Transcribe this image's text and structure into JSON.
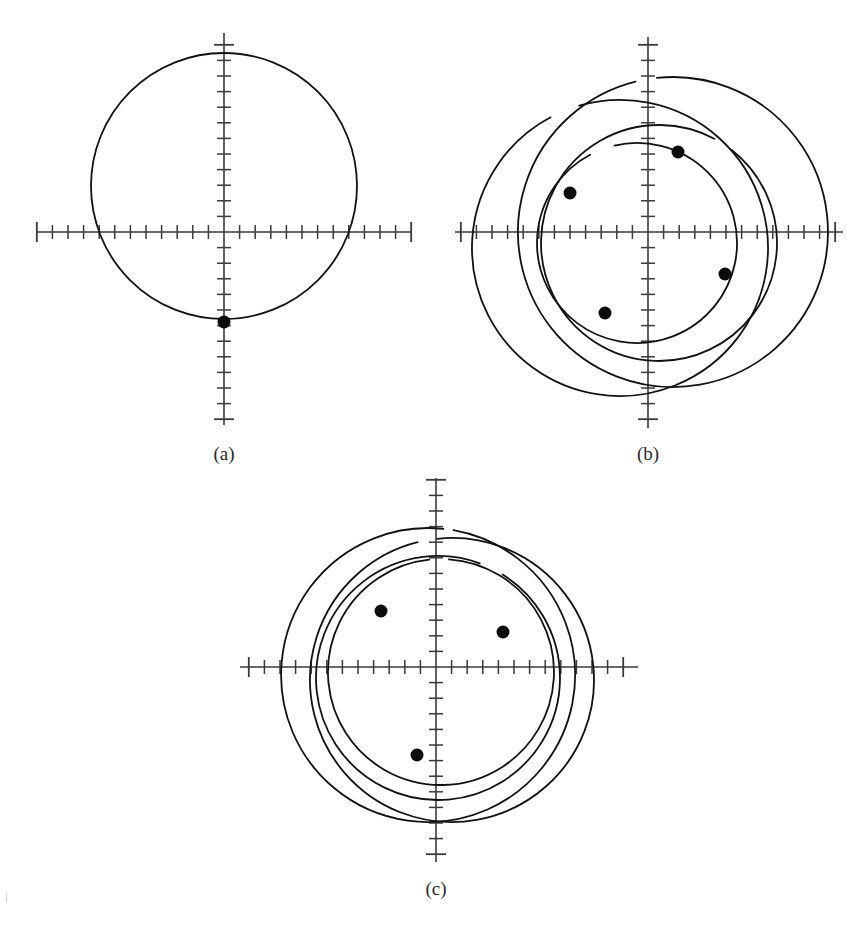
{
  "figure": {
    "domain": "Chart",
    "background_color": "#ffffff",
    "ink_color": "#111111",
    "axis_color": "#3a3a3a",
    "marker_color": "#0b0b0b",
    "width": 866,
    "height": 930,
    "panel_labels": {
      "a": "(a)",
      "b": "(b)",
      "c": "(c)"
    },
    "footer_text_fragment": ""
  },
  "chart_data": {
    "type": "line",
    "title": "",
    "subtitle": "",
    "xlabel": "",
    "ylabel": "",
    "grid": false,
    "legend": "none",
    "panel_count": 3,
    "panels": [
      {
        "id": "a",
        "label": "(a)",
        "label_position": {
          "x": 224,
          "y": 460
        },
        "origin": {
          "x": 224,
          "y": 232
        },
        "xaxis": {
          "x_start": 36,
          "x_end": 412,
          "ticks_left": 12,
          "ticks_right": 12,
          "tick_spacing": 15.6,
          "tick_half_len": 7,
          "end_tick_half_len": 10
        },
        "yaxis": {
          "y_start": 33,
          "y_end": 425,
          "ticks_up": 12,
          "ticks_down": 12,
          "tick_spacing": 15.6,
          "tick_half_len": 7,
          "end_tick_half_len": 10
        },
        "curves": [
          {
            "name": "orbit-1",
            "kind": "circle",
            "cx": 224,
            "cy": 186,
            "r": 133,
            "start_deg": 0,
            "sweep_deg": 360
          }
        ],
        "markers": [
          {
            "name": "marker-1",
            "x": 224,
            "y": 322,
            "r": 6.5
          }
        ],
        "notes": "single closed circular orbit; marker sits on the lower intersection of the circle with the vertical axis"
      },
      {
        "id": "b",
        "label": "(b)",
        "label_position": {
          "x": 648,
          "y": 460
        },
        "origin": {
          "x": 648,
          "y": 232
        },
        "xaxis": {
          "x_start": 455,
          "x_end": 843,
          "ticks_left": 12,
          "ticks_right": 12,
          "tick_spacing": 15.6,
          "tick_half_len": 7,
          "end_tick_half_len": 10
        },
        "yaxis": {
          "y_start": 37,
          "y_end": 428,
          "ticks_up": 12,
          "ticks_down": 12,
          "tick_spacing": 15.6,
          "tick_half_len": 7,
          "end_tick_half_len": 10
        },
        "curves": [
          {
            "name": "orbit-1",
            "kind": "arc",
            "cx": 673,
            "cy": 232,
            "r": 155,
            "start_deg": 104,
            "sweep_deg": 352
          },
          {
            "name": "orbit-2",
            "kind": "arc",
            "cx": 620,
            "cy": 248,
            "r": 148,
            "start_deg": 118,
            "sweep_deg": 348
          },
          {
            "name": "orbit-3",
            "kind": "arc",
            "cx": 659,
            "cy": 243,
            "r": 118,
            "start_deg": 62,
            "sweep_deg": 350
          },
          {
            "name": "orbit-4",
            "kind": "arc",
            "cx": 637,
            "cy": 243,
            "r": 100,
            "start_deg": 118,
            "sweep_deg": 345
          }
        ],
        "markers": [
          {
            "name": "marker-1",
            "x": 678,
            "y": 152,
            "r": 6.5
          },
          {
            "name": "marker-2",
            "x": 570,
            "y": 193,
            "r": 6.5
          },
          {
            "name": "marker-3",
            "x": 605,
            "y": 313,
            "r": 6.5
          },
          {
            "name": "marker-4",
            "x": 725,
            "y": 274,
            "r": 6.5
          }
        ],
        "notes": "four circular orbits of differing radii and offset centres producing a rosette; each open arc terminates in a filled marker"
      },
      {
        "id": "c",
        "label": "(c)",
        "label_position": {
          "x": 436,
          "y": 895
        },
        "origin": {
          "x": 436,
          "y": 667
        },
        "xaxis": {
          "x_start": 240,
          "x_end": 638,
          "ticks_left": 12,
          "ticks_right": 12,
          "tick_spacing": 15.6,
          "tick_half_len": 7,
          "end_tick_half_len": 10
        },
        "yaxis": {
          "y_start": 478,
          "y_end": 862,
          "ticks_up": 12,
          "ticks_down": 12,
          "tick_spacing": 15.6,
          "tick_half_len": 7,
          "end_tick_half_len": 10
        },
        "curves": [
          {
            "name": "orbit-1",
            "kind": "arc",
            "cx": 428,
            "cy": 675,
            "r": 147,
            "start_deg": 84,
            "sweep_deg": 356
          },
          {
            "name": "orbit-2",
            "kind": "arc",
            "cx": 452,
            "cy": 680,
            "r": 142,
            "start_deg": 104,
            "sweep_deg": 352
          },
          {
            "name": "orbit-3",
            "kind": "arc",
            "cx": 438,
            "cy": 678,
            "r": 122,
            "start_deg": 70,
            "sweep_deg": 348
          },
          {
            "name": "orbit-4",
            "kind": "arc",
            "cx": 441,
            "cy": 672,
            "r": 113,
            "start_deg": 96,
            "sweep_deg": 350
          }
        ],
        "markers": [
          {
            "name": "marker-1",
            "x": 381,
            "y": 611,
            "r": 6.5
          },
          {
            "name": "marker-2",
            "x": 503,
            "y": 632,
            "r": 6.5
          },
          {
            "name": "marker-3",
            "x": 417,
            "y": 755,
            "r": 6.5
          }
        ],
        "notes": "four near-concentric circular orbits with small centre offsets; three filled end markers visible"
      }
    ]
  }
}
